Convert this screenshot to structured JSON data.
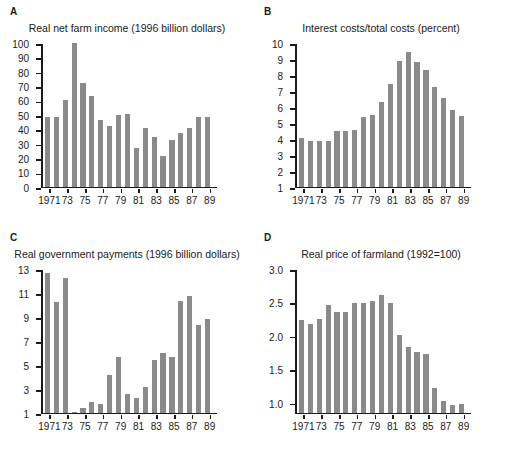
{
  "figure": {
    "background": "#ffffff",
    "bar_color": "#8a8a8a",
    "axis_color": "#1a1a1a"
  },
  "panels": [
    {
      "letter": "A",
      "title": "Real net farm income (1996 billion dollars)"
    },
    {
      "letter": "B",
      "title": "Interest costs/total costs (percent)"
    },
    {
      "letter": "C",
      "title": "Real government payments (1996 billion dollars)"
    },
    {
      "letter": "D",
      "title": "Real price of farmland (1992=100)"
    }
  ],
  "chart_data": [
    {
      "type": "bar",
      "panel": "A",
      "title": "Real net farm income (1996 billion dollars)",
      "xlabel": "",
      "ylabel": "",
      "ylim": [
        0,
        100
      ],
      "yticks": [
        "0",
        "10",
        "20",
        "30",
        "40",
        "50",
        "60",
        "70",
        "80",
        "90",
        "100"
      ],
      "ytick_values": [
        0,
        10,
        20,
        30,
        40,
        50,
        60,
        70,
        80,
        90,
        100
      ],
      "grid": false,
      "legend": null,
      "categories": [
        1971,
        1972,
        1973,
        1974,
        1975,
        1976,
        1977,
        1978,
        1979,
        1980,
        1981,
        1982,
        1983,
        1984,
        1985,
        1986,
        1987,
        1988,
        1989
      ],
      "xtick_labels": [
        "1971",
        "73",
        "75",
        "77",
        "79",
        "81",
        "83",
        "85",
        "87",
        "89"
      ],
      "xtick_years": [
        1971,
        1973,
        1975,
        1977,
        1979,
        1981,
        1983,
        1985,
        1987,
        1989
      ],
      "values": [
        48.5,
        48.5,
        60.0,
        101.0,
        72.0,
        63.0,
        46.0,
        42.0,
        49.5,
        50.5,
        27.0,
        40.5,
        34.5,
        21.0,
        32.5,
        37.5,
        40.5,
        48.5,
        48.0,
        54.5
      ]
    },
    {
      "type": "bar",
      "panel": "B",
      "title": "Interest costs/total costs (percent)",
      "xlabel": "",
      "ylabel": "",
      "ylim": [
        1,
        10
      ],
      "yticks": [
        "1",
        "2",
        "3",
        "4",
        "5",
        "6",
        "7",
        "8",
        "9",
        "10"
      ],
      "ytick_values": [
        1,
        2,
        3,
        4,
        5,
        6,
        7,
        8,
        9,
        10
      ],
      "grid": false,
      "legend": null,
      "categories": [
        1971,
        1972,
        1973,
        1974,
        1975,
        1976,
        1977,
        1978,
        1979,
        1980,
        1981,
        1982,
        1983,
        1984,
        1985,
        1986,
        1987,
        1988,
        1989
      ],
      "xtick_labels": [
        "1971",
        "73",
        "75",
        "77",
        "79",
        "81",
        "83",
        "85",
        "87",
        "89"
      ],
      "xtick_years": [
        1971,
        1973,
        1975,
        1977,
        1979,
        1981,
        1983,
        1985,
        1987,
        1989
      ],
      "values": [
        4.05,
        3.85,
        3.85,
        3.85,
        4.5,
        4.5,
        4.55,
        5.35,
        5.5,
        6.3,
        7.4,
        8.85,
        9.4,
        8.8,
        8.3,
        7.25,
        6.55,
        5.8,
        5.4,
        5.05
      ]
    },
    {
      "type": "bar",
      "panel": "C",
      "title": "Real government payments (1996 billion dollars)",
      "xlabel": "",
      "ylabel": "",
      "ylim": [
        1,
        13
      ],
      "yticks": [
        "1",
        "3",
        "5",
        "7",
        "9",
        "11",
        "13"
      ],
      "ytick_values": [
        1,
        3,
        5,
        7,
        9,
        11,
        13
      ],
      "grid": false,
      "legend": null,
      "categories": [
        1971,
        1972,
        1973,
        1974,
        1975,
        1976,
        1977,
        1978,
        1979,
        1980,
        1981,
        1982,
        1983,
        1984,
        1985,
        1986,
        1987,
        1988,
        1989
      ],
      "xtick_labels": [
        "1971",
        "73",
        "75",
        "77",
        "79",
        "81",
        "83",
        "85",
        "87",
        "89"
      ],
      "xtick_years": [
        1971,
        1973,
        1975,
        1977,
        1979,
        1981,
        1983,
        1985,
        1987,
        1989
      ],
      "values": [
        12.6,
        10.2,
        12.2,
        1.05,
        1.35,
        1.9,
        1.7,
        4.1,
        5.6,
        2.55,
        2.2,
        3.1,
        5.35,
        5.95,
        5.65,
        10.3,
        10.7,
        8.3,
        8.8,
        10.85
      ]
    },
    {
      "type": "bar",
      "panel": "D",
      "title": "Real price of farmland (1992=100)",
      "xlabel": "",
      "ylabel": "",
      "ylim": [
        0.85,
        3.0
      ],
      "yticks": [
        "1.0",
        "1.5",
        "2.0",
        "2.5",
        "3.0"
      ],
      "ytick_values": [
        1.0,
        1.5,
        2.0,
        2.5,
        3.0
      ],
      "grid": false,
      "legend": null,
      "categories": [
        1971,
        1972,
        1973,
        1974,
        1975,
        1976,
        1977,
        1978,
        1979,
        1980,
        1981,
        1982,
        1983,
        1984,
        1985,
        1986,
        1987,
        1988,
        1989
      ],
      "xtick_labels": [
        "1971",
        "73",
        "75",
        "77",
        "79",
        "81",
        "83",
        "85",
        "87",
        "89"
      ],
      "xtick_years": [
        1971,
        1973,
        1975,
        1977,
        1979,
        1981,
        1983,
        1985,
        1987,
        1989
      ],
      "values": [
        2.23,
        2.17,
        2.24,
        2.46,
        2.35,
        2.35,
        2.49,
        2.49,
        2.51,
        2.6,
        2.48,
        2.01,
        1.83,
        1.76,
        1.73,
        1.21,
        1.02,
        0.96,
        0.97,
        0.99
      ]
    }
  ]
}
